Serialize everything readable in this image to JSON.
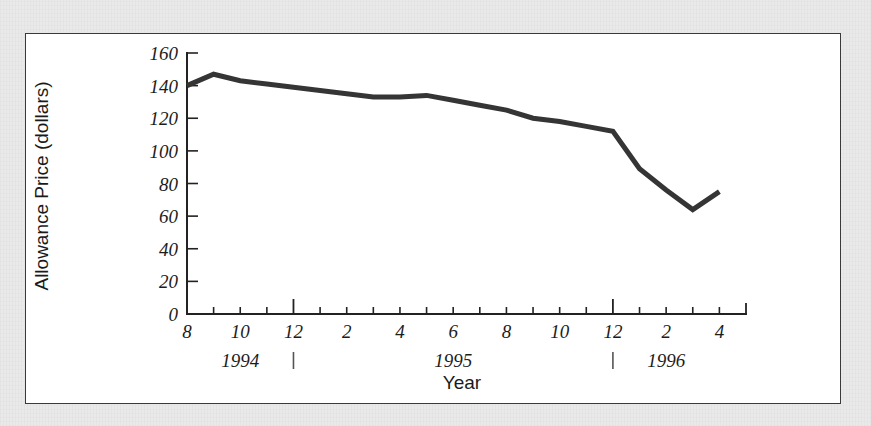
{
  "figure": {
    "background_color": "#e9e9e9",
    "panel_color": "#ffffff",
    "panel_border_color": "#3a3a3a",
    "line_color": "#353535"
  },
  "chart_data": {
    "type": "line",
    "title": "",
    "xlabel": "Year",
    "ylabel": "Allowance Price (dollars)",
    "ylim": [
      0,
      160
    ],
    "xlim": [
      0,
      21
    ],
    "grid": false,
    "legend": false,
    "y_ticks": [
      0,
      20,
      40,
      60,
      80,
      100,
      120,
      140,
      160
    ],
    "y_tick_labels": [
      "0",
      "20",
      "40",
      "60",
      "80",
      "100",
      "120",
      "140",
      "160"
    ],
    "x_tick_labels": [
      "8",
      "10",
      "12",
      "2",
      "4",
      "6",
      "8",
      "10",
      "12",
      "2",
      "4"
    ],
    "x_tick_positions": [
      0,
      2,
      4,
      6,
      8,
      10,
      12,
      14,
      16,
      18,
      20
    ],
    "x_minor_positions": [
      1,
      3,
      5,
      7,
      9,
      11,
      13,
      15,
      17,
      19
    ],
    "long_tick_positions": [
      4,
      16
    ],
    "year_group_labels": [
      {
        "label": "1994",
        "x_position": 2.0
      },
      {
        "label": "1995",
        "x_position": 10.0
      },
      {
        "label": "1996",
        "x_position": 18.0
      }
    ],
    "year_divider_positions": [
      4,
      16
    ],
    "x": [
      0,
      1,
      2,
      3,
      4,
      5,
      6,
      7,
      8,
      9,
      10,
      11,
      12,
      13,
      14,
      15,
      16,
      17,
      18,
      19,
      20
    ],
    "x_point_labels": [
      "1994-08",
      "1994-09",
      "1994-10",
      "1994-11",
      "1994-12",
      "1995-01",
      "1995-02",
      "1995-03",
      "1995-04",
      "1995-05",
      "1995-06",
      "1995-07",
      "1995-08",
      "1995-09",
      "1995-10",
      "1995-11",
      "1995-12",
      "1996-01",
      "1996-02",
      "1996-03",
      "1996-04"
    ],
    "values": [
      140,
      147,
      143,
      141,
      139,
      137,
      135,
      133,
      133,
      134,
      131,
      128,
      125,
      120,
      118,
      115,
      112,
      89,
      76,
      64,
      75
    ],
    "series": [
      {
        "name": "Allowance Price",
        "values": [
          140,
          147,
          143,
          141,
          139,
          137,
          135,
          133,
          133,
          134,
          131,
          128,
          125,
          120,
          118,
          115,
          112,
          89,
          76,
          64,
          75
        ]
      }
    ]
  }
}
